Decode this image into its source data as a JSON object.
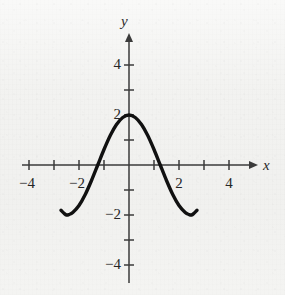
{
  "chart_data": {
    "type": "line",
    "title": "",
    "subtitle": "",
    "xlabel": "x",
    "ylabel": "y",
    "xlim": [
      -4.8,
      4.8
    ],
    "ylim": [
      -4.8,
      4.8
    ],
    "grid": false,
    "legend": null,
    "legend_position": "none",
    "x_ticks": [
      -4,
      -3,
      -2,
      -1,
      1,
      2,
      3,
      4
    ],
    "y_ticks": [
      -4,
      -3,
      -2,
      -1,
      1,
      2,
      3,
      4
    ],
    "x_tick_labels_shown": [
      "-4",
      "-2",
      "2",
      "4"
    ],
    "y_tick_labels_shown": [
      "4",
      "2",
      "-2",
      "-4"
    ],
    "series": [
      {
        "name": "curve",
        "description": "cosine-like curve, amplitude 2, period 5",
        "color": "#111111",
        "line_width": 3.4,
        "x_domain": [
          -2.72,
          2.72
        ],
        "points": [
          {
            "x": -2.72,
            "y": -1.81
          },
          {
            "x": -2.6,
            "y": -1.93
          },
          {
            "x": -2.5,
            "y": -2.0
          },
          {
            "x": -2.4,
            "y": -1.98
          },
          {
            "x": -2.25,
            "y": -1.9
          },
          {
            "x": -2.0,
            "y": -1.62
          },
          {
            "x": -1.75,
            "y": -1.18
          },
          {
            "x": -1.5,
            "y": -0.62
          },
          {
            "x": -1.25,
            "y": 0.0
          },
          {
            "x": -1.0,
            "y": 0.62
          },
          {
            "x": -0.75,
            "y": 1.18
          },
          {
            "x": -0.5,
            "y": 1.62
          },
          {
            "x": -0.25,
            "y": 1.9
          },
          {
            "x": 0.0,
            "y": 2.0
          },
          {
            "x": 0.25,
            "y": 1.9
          },
          {
            "x": 0.5,
            "y": 1.62
          },
          {
            "x": 0.75,
            "y": 1.18
          },
          {
            "x": 1.0,
            "y": 0.62
          },
          {
            "x": 1.25,
            "y": 0.0
          },
          {
            "x": 1.5,
            "y": -0.62
          },
          {
            "x": 1.75,
            "y": -1.18
          },
          {
            "x": 2.0,
            "y": -1.62
          },
          {
            "x": 2.25,
            "y": -1.9
          },
          {
            "x": 2.4,
            "y": -1.98
          },
          {
            "x": 2.5,
            "y": -2.0
          },
          {
            "x": 2.6,
            "y": -1.93
          },
          {
            "x": 2.72,
            "y": -1.81
          }
        ],
        "key_points": {
          "maximum": {
            "x": 0,
            "y": 2
          },
          "minima": [
            {
              "x": -2.5,
              "y": -2
            },
            {
              "x": 2.5,
              "y": -2
            }
          ],
          "x_intercepts": [
            -1.25,
            1.25
          ],
          "y_intercept": 2
        }
      }
    ]
  },
  "axes": {
    "x_axis_label": "x",
    "y_axis_label": "y",
    "x_arrow": true,
    "y_arrow": true,
    "axis_color": "#3b3b3b"
  },
  "colors": {
    "background": "#f2f2f0",
    "curve": "#111111",
    "axis": "#3b3b3b",
    "text": "#262626"
  }
}
